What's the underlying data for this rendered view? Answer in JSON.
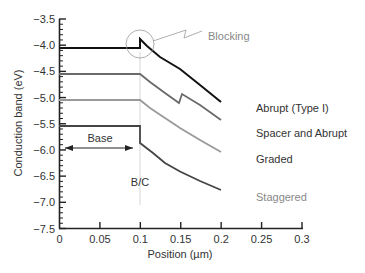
{
  "chart_data": {
    "type": "line",
    "title": "",
    "xlabel": "Position (µm)",
    "ylabel": "Conduction band (eV)",
    "xlim": [
      0,
      0.3
    ],
    "ylim": [
      -7.5,
      -3.5
    ],
    "x_ticks": [
      "0",
      "0.05",
      "0.1",
      "0.15",
      "0.2",
      "0.25",
      "0.3"
    ],
    "y_ticks": [
      "-3.5",
      "-4.0",
      "-4.5",
      "-5.0",
      "-5.5",
      "-6.0",
      "-6.5",
      "-7.0",
      "-7.5"
    ],
    "grid": false,
    "legend_position": "inline labels at right end of curves",
    "series": [
      {
        "name": "Abrupt (Type I)",
        "color": "#111111",
        "points": [
          [
            0,
            -4.05
          ],
          [
            0.1,
            -4.05
          ],
          [
            0.1,
            -3.88
          ],
          [
            0.125,
            -4.17
          ],
          [
            0.15,
            -4.42
          ],
          [
            0.175,
            -4.75
          ],
          [
            0.2,
            -5.22
          ]
        ]
      },
      {
        "name": "Spacer and Abrupt",
        "color": "#666666",
        "points": [
          [
            0,
            -4.55
          ],
          [
            0.1,
            -4.55
          ],
          [
            0.125,
            -4.95
          ],
          [
            0.148,
            -5.3
          ],
          [
            0.152,
            -5.12
          ],
          [
            0.175,
            -5.38
          ],
          [
            0.2,
            -5.72
          ]
        ]
      },
      {
        "name": "Graded",
        "color": "#999999",
        "points": [
          [
            0,
            -5.05
          ],
          [
            0.1,
            -5.05
          ],
          [
            0.125,
            -5.4
          ],
          [
            0.15,
            -5.67
          ],
          [
            0.175,
            -5.95
          ],
          [
            0.2,
            -6.22
          ]
        ]
      },
      {
        "name": "Staggered",
        "color": "#444444",
        "points": [
          [
            0,
            -5.55
          ],
          [
            0.1,
            -5.55
          ],
          [
            0.1,
            -5.88
          ],
          [
            0.125,
            -6.25
          ],
          [
            0.15,
            -6.55
          ],
          [
            0.175,
            -6.8
          ],
          [
            0.2,
            -7.02
          ]
        ]
      }
    ],
    "annotations": [
      {
        "text": "Blocking",
        "type": "circle-callout",
        "at": [
          0.1,
          -3.95
        ]
      },
      {
        "text": "Base",
        "type": "double-arrow",
        "from": 0,
        "to": 0.1,
        "y": -6.0
      },
      {
        "text": "B/C",
        "type": "vertical-reference-line",
        "x": 0.1
      }
    ]
  },
  "labels": {
    "blocking": "Blocking",
    "base": "Base",
    "bc": "B/C",
    "xlabel": "Position (µm)",
    "ylabel": "Conduction band (eV)",
    "series": [
      "Abrupt (Type I)",
      "Spacer and Abrupt",
      "Graded",
      "Staggered"
    ],
    "x_ticks": [
      "0",
      "0.05",
      "0.1",
      "0.15",
      "0.2",
      "0.25",
      "0.3"
    ],
    "y_ticks": [
      "−3.5",
      "−4.0",
      "−4.5",
      "−5.0",
      "−5.5",
      "−6.0",
      "−6.5",
      "−7.0",
      "−7.5"
    ]
  }
}
